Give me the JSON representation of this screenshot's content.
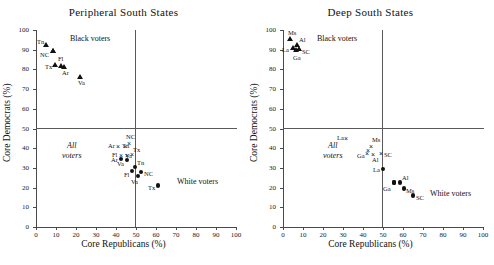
{
  "figure": {
    "xlabel": "Core Republicans (%)",
    "ylabel": "Core Democrats (%)",
    "x_ticks": [
      0,
      10,
      20,
      30,
      40,
      50,
      60,
      70,
      80,
      90,
      100
    ],
    "y_ticks": [
      0,
      10,
      20,
      30,
      40,
      50,
      60,
      70,
      80,
      90,
      100
    ],
    "reference_lines": {
      "vertical_x": 50,
      "horizontal_y": 50
    },
    "group_labels": {
      "black": "Black voters",
      "white": "White voters",
      "all_line1": "All",
      "all_line2": "voters"
    }
  },
  "chart_data": [
    {
      "type": "scatter",
      "title": "Peripheral South States",
      "xlabel": "Core Republicans (%)",
      "ylabel": "Core Democrats (%)",
      "xlim": [
        0,
        100
      ],
      "ylim": [
        0,
        100
      ],
      "grid": false,
      "legend": "inline annotations",
      "reference_lines": [
        {
          "orientation": "vertical",
          "value": 50
        },
        {
          "orientation": "horizontal",
          "value": 50
        }
      ],
      "annotations": [
        "Black voters",
        "All voters",
        "White voters"
      ],
      "series": [
        {
          "name": "Black voters",
          "marker": "triangle",
          "points": [
            {
              "label": "Tn",
              "x": 5.0,
              "y": 92.0,
              "lx": -9,
              "ly": -4
            },
            {
              "label": "",
              "x": 8.5,
              "y": 89.0,
              "lx": 0,
              "ly": 0
            },
            {
              "label": "NC",
              "x": 8.5,
              "y": 89.0,
              "lx": -13,
              "ly": 3
            },
            {
              "label": "Tx",
              "x": 9.5,
              "y": 82.0,
              "lx": -10,
              "ly": 2
            },
            {
              "label": "Fl",
              "x": 12.5,
              "y": 81.5,
              "lx": -3,
              "ly": -7
            },
            {
              "label": "Ar",
              "x": 14.0,
              "y": 81.0,
              "lx": -2,
              "ly": 6
            },
            {
              "label": "Va",
              "x": 22.0,
              "y": 76.0,
              "lx": -2,
              "ly": 6
            }
          ]
        },
        {
          "name": "All voters",
          "marker": "x",
          "points": [
            {
              "label": "Ar",
              "x": 41.0,
              "y": 40.5,
              "lx": -10,
              "ly": -1
            },
            {
              "label": "Tn",
              "x": 44.5,
              "y": 40.5,
              "lx": -3,
              "ly": -1
            },
            {
              "label": "NC",
              "x": 46.5,
              "y": 42.0,
              "lx": -3,
              "ly": -7
            },
            {
              "label": "Fl",
              "x": 42.5,
              "y": 36.0,
              "lx": -9,
              "ly": -1
            },
            {
              "label": "Va",
              "x": 45.5,
              "y": 36.0,
              "lx": -2,
              "ly": 0
            },
            {
              "label": "Tx",
              "x": 48.0,
              "y": 36.5,
              "lx": 1,
              "ly": -5
            }
          ]
        },
        {
          "name": "White voters",
          "marker": "circle",
          "points": [
            {
              "label": "Ar",
              "x": 42.5,
              "y": 34.5,
              "lx": -10,
              "ly": 1
            },
            {
              "label": "Va",
              "x": 45.5,
              "y": 34.0,
              "lx": -10,
              "ly": 4
            },
            {
              "label": "Tn",
              "x": 49.5,
              "y": 30.5,
              "lx": 2,
              "ly": -4
            },
            {
              "label": "Fl",
              "x": 48.0,
              "y": 28.5,
              "lx": -8,
              "ly": 4
            },
            {
              "label": "NC",
              "x": 52.5,
              "y": 28.0,
              "lx": 3,
              "ly": 2
            },
            {
              "label": "Va",
              "x": 51.0,
              "y": 26.0,
              "lx": -7,
              "ly": 6
            },
            {
              "label": "Tx",
              "x": 61.0,
              "y": 21.0,
              "lx": -10,
              "ly": 2
            }
          ]
        }
      ]
    },
    {
      "type": "scatter",
      "title": "Deep South States",
      "xlabel": "Core Republicans (%)",
      "ylabel": "Core Democrats (%)",
      "xlim": [
        0,
        100
      ],
      "ylim": [
        0,
        100
      ],
      "grid": false,
      "legend": "inline annotations",
      "reference_lines": [
        {
          "orientation": "vertical",
          "value": 50
        },
        {
          "orientation": "horizontal",
          "value": 50
        }
      ],
      "annotations": [
        "Black voters",
        "All voters",
        "White voters"
      ],
      "series": [
        {
          "name": "Black voters",
          "marker": "triangle",
          "points": [
            {
              "label": "Ms",
              "x": 3.5,
              "y": 95.0,
              "lx": -2,
              "ly": -7
            },
            {
              "label": "Al",
              "x": 7.0,
              "y": 92.0,
              "lx": 2,
              "ly": -6
            },
            {
              "label": "La",
              "x": 5.0,
              "y": 90.5,
              "lx": -11,
              "ly": 1
            },
            {
              "label": "SC",
              "x": 8.0,
              "y": 90.0,
              "lx": 3,
              "ly": 2
            },
            {
              "label": "Ga",
              "x": 6.5,
              "y": 89.5,
              "lx": -3,
              "ly": 7
            }
          ]
        },
        {
          "name": "All voters",
          "marker": "x",
          "points": [
            {
              "label": "La",
              "x": 31.5,
              "y": 44.5,
              "lx": -9,
              "ly": -1
            },
            {
              "label": "Ms",
              "x": 44.0,
              "y": 40.5,
              "lx": 1,
              "ly": -7
            },
            {
              "label": "",
              "x": 42.5,
              "y": 38.5,
              "lx": 0,
              "ly": 0
            },
            {
              "label": "Ga",
              "x": 42.0,
              "y": 37.0,
              "lx": -10,
              "ly": 2
            },
            {
              "label": "Al",
              "x": 45.0,
              "y": 36.5,
              "lx": -1,
              "ly": 5
            },
            {
              "label": "SC",
              "x": 49.0,
              "y": 37.0,
              "lx": 3,
              "ly": 1
            }
          ]
        },
        {
          "name": "White voters",
          "marker": "circle",
          "points": [
            {
              "label": "La",
              "x": 50.0,
              "y": 29.5,
              "lx": -10,
              "ly": 1
            },
            {
              "label": "",
              "x": 55.5,
              "y": 22.5,
              "lx": 0,
              "ly": 0
            },
            {
              "label": "Al",
              "x": 58.5,
              "y": 22.5,
              "lx": 2,
              "ly": -5
            },
            {
              "label": "Ga",
              "x": 55.5,
              "y": 22.5,
              "lx": -11,
              "ly": 6
            },
            {
              "label": "Ms",
              "x": 60.5,
              "y": 19.5,
              "lx": 2,
              "ly": 2
            },
            {
              "label": "SC",
              "x": 65.0,
              "y": 16.0,
              "lx": 3,
              "ly": 3
            }
          ]
        }
      ]
    }
  ]
}
